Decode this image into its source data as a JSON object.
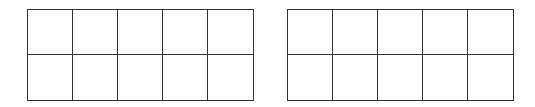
{
  "diagram": {
    "type": "ten-frames",
    "frames": [
      {
        "name": "left",
        "rows": 2,
        "cols": 5,
        "filled": 0
      },
      {
        "name": "right",
        "rows": 2,
        "cols": 5,
        "filled": 0
      }
    ],
    "line_color": "#333333",
    "background": "#ffffff"
  }
}
